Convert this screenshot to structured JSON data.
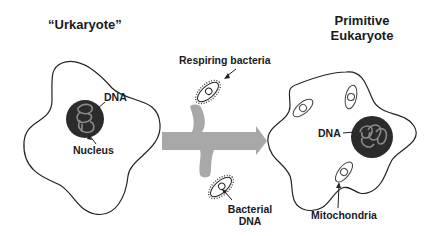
{
  "diagram": {
    "left_cell": {
      "title": "“Urkaryote”",
      "labels": {
        "dna": "DNA",
        "nucleus": "Nucleus"
      }
    },
    "middle": {
      "labels": {
        "respiring_bacteria": "Respiring bacteria",
        "bacterial_dna_line1": "Bacterial",
        "bacterial_dna_line2": "DNA"
      }
    },
    "right_cell": {
      "title_line1": "Primitive",
      "title_line2": "Eukaryote",
      "labels": {
        "dna": "DNA",
        "mitochondria": "Mitochondria"
      }
    },
    "colors": {
      "outline": "#222222",
      "nucleus_fill": "#2b2b2b",
      "dna_strand": "#8a8a8a",
      "arrow_fill": "#a8a8a8"
    }
  }
}
